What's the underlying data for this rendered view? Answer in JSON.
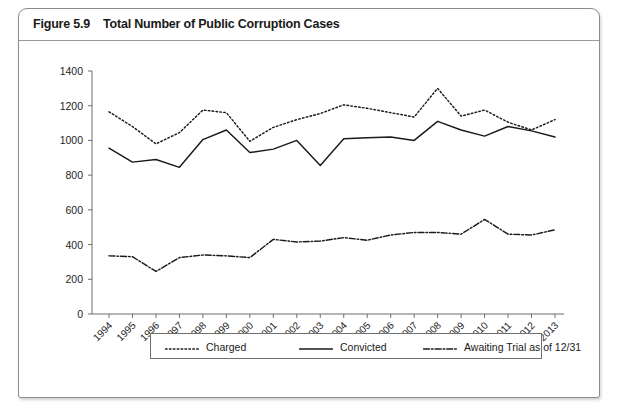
{
  "figure": {
    "label": "Figure 5.9",
    "title": "Total Number of Public Corruption Cases"
  },
  "legend": {
    "items": [
      {
        "label": "Charged",
        "style": "dotted",
        "name": "legend-charged"
      },
      {
        "label": "Convicted",
        "style": "solid",
        "name": "legend-convicted"
      },
      {
        "label": "Awaiting Trial as of 12/31",
        "style": "dash-dot",
        "name": "legend-awaiting"
      }
    ]
  },
  "chart_data": {
    "type": "line",
    "title": "Total Number of Public Corruption Cases",
    "xlabel": "",
    "ylabel": "",
    "ylim": [
      0,
      1400
    ],
    "yticks": [
      0,
      200,
      400,
      600,
      800,
      1000,
      1200,
      1400
    ],
    "grid": false,
    "legend_position": "bottom",
    "x_tick_rotation": -45,
    "categories": [
      "1994",
      "1995",
      "1996",
      "1997",
      "1998",
      "1999",
      "2000",
      "2001",
      "2002",
      "2003",
      "2004",
      "2005",
      "2006",
      "2007",
      "2008",
      "2009",
      "2010",
      "2011",
      "2012",
      "2013"
    ],
    "series": [
      {
        "name": "Charged",
        "style": "dotted",
        "values": [
          1165,
          1080,
          980,
          1045,
          1175,
          1160,
          995,
          1075,
          1120,
          1155,
          1205,
          1185,
          1160,
          1135,
          1300,
          1140,
          1175,
          1105,
          1060,
          1120
        ]
      },
      {
        "name": "Convicted",
        "style": "solid",
        "values": [
          955,
          875,
          890,
          845,
          1005,
          1060,
          930,
          950,
          1000,
          855,
          1010,
          1015,
          1020,
          1000,
          1110,
          1060,
          1025,
          1080,
          1055,
          1020
        ]
      },
      {
        "name": "Awaiting Trial as of 12/31",
        "style": "dash-dot",
        "values": [
          335,
          330,
          245,
          325,
          340,
          335,
          325,
          430,
          415,
          420,
          440,
          425,
          455,
          470,
          470,
          460,
          545,
          460,
          455,
          485
        ]
      }
    ]
  }
}
